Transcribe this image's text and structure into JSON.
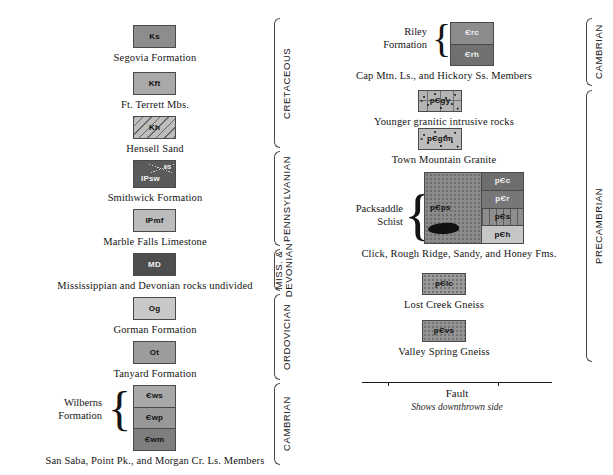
{
  "document": {
    "type": "geologic-map-legend",
    "title": "Geologic Map Explanation"
  },
  "left_column": {
    "units": [
      {
        "id": "segovia",
        "symbol": "Ks",
        "caption": "Segovia Formation",
        "color": "#8d8d8d",
        "label_tone": "dark"
      },
      {
        "id": "ft-terrett",
        "symbol": "Kft",
        "caption": "Ft. Terrett Mbs.",
        "color": "#a9a9a9",
        "label_tone": "dark"
      },
      {
        "id": "hensell",
        "symbol": "Kh",
        "caption": "Hensell Sand",
        "color": "#bdbdbd",
        "label_tone": "dark"
      },
      {
        "id": "smithwick",
        "symbol": "IPsw",
        "sub_symbol": "ss",
        "caption": "Smithwick Formation",
        "color": "#5a5a5a",
        "label_tone": "light"
      },
      {
        "id": "marble-falls",
        "symbol": "IPmf",
        "caption": "Marble Falls Limestone",
        "color": "#bcbcbc",
        "label_tone": "dark"
      },
      {
        "id": "miss-dev",
        "symbol": "MD",
        "caption": "Mississippian and Devonian rocks undivided",
        "color": "#4e4e4e",
        "label_tone": "light"
      },
      {
        "id": "gorman",
        "symbol": "Og",
        "caption": "Gorman Formation",
        "color": "#c8c8c8",
        "label_tone": "dark"
      },
      {
        "id": "tanyard",
        "symbol": "Ot",
        "caption": "Tanyard Formation",
        "color": "#9c9c9c",
        "label_tone": "dark"
      }
    ],
    "wilberns": {
      "group_label_line1": "Wilberns",
      "group_label_line2": "Formation",
      "caption": "San Saba, Point Pk., and Morgan Cr. Ls. Members",
      "cells": [
        {
          "symbol": "Єws",
          "color": "#a8a8a8",
          "label_tone": "dark"
        },
        {
          "symbol": "Єwp",
          "color": "#989898",
          "label_tone": "dark"
        },
        {
          "symbol": "Єwm",
          "color": "#7e7e7e",
          "label_tone": "dark"
        }
      ]
    },
    "eras": [
      {
        "label": "CRETACEOUS",
        "lines": 1
      },
      {
        "label": "PENNSYLVANIAN",
        "lines": 1
      },
      {
        "label": "MISS. &\nDEVONIAN",
        "lines": 2
      },
      {
        "label": "ORDOVICIAN",
        "lines": 1
      },
      {
        "label": "CAMBRIAN",
        "lines": 1
      }
    ]
  },
  "right_column": {
    "riley": {
      "group_label_line1": "Riley",
      "group_label_line2": "Formation",
      "caption": "Cap Mtn. Ls., and Hickory Ss. Members",
      "cells": [
        {
          "symbol": "Єrc",
          "color": "#8c8c8c",
          "label_tone": "light"
        },
        {
          "symbol": "Єrh",
          "color": "#707070",
          "label_tone": "light"
        }
      ]
    },
    "units": [
      {
        "id": "younger-granite",
        "symbol": "pЄgy",
        "caption": "Younger granitic intrusive rocks",
        "color": "#b4b4b4",
        "label_tone": "dark",
        "texture": "granite"
      },
      {
        "id": "town-mountain-granite",
        "symbol": "pЄgtm",
        "caption": "Town Mountain Granite",
        "color": "#bcbcbc",
        "label_tone": "dark",
        "texture": "granite"
      }
    ],
    "packsaddle": {
      "group_label_line1": "Packsaddle",
      "group_label_line2": "Schist",
      "caption": "Click, Rough Ridge, Sandy, and Honey Fms.",
      "main_cell": {
        "symbol": "pЄps",
        "color": "#8a8a8a",
        "label_tone": "dark"
      },
      "sub_cells": [
        {
          "symbol": "pЄc",
          "color": "#6e6e6e",
          "label_tone": "light"
        },
        {
          "symbol": "pЄr",
          "color": "#777777",
          "label_tone": "light"
        },
        {
          "symbol": "pЄs",
          "color": "#8e8e8e",
          "label_tone": "dark"
        },
        {
          "symbol": "pЄh",
          "color": "#c6c6c6",
          "label_tone": "dark"
        }
      ]
    },
    "gneiss": [
      {
        "id": "lost-creek-gneiss",
        "symbol": "pЄlc",
        "caption": "Lost Creek Gneiss",
        "color": "#9a9a9a",
        "label_tone": "dark"
      },
      {
        "id": "valley-spring-gneiss",
        "symbol": "pЄvs",
        "caption": "Valley Spring Gneiss",
        "color": "#949494",
        "label_tone": "dark"
      }
    ],
    "eras": [
      {
        "label": "CAMBRIAN",
        "lines": 1
      },
      {
        "label": "PRECAMBRIAN",
        "lines": 1
      }
    ],
    "fault": {
      "title": "Fault",
      "note": "Shows downthrown side"
    }
  }
}
